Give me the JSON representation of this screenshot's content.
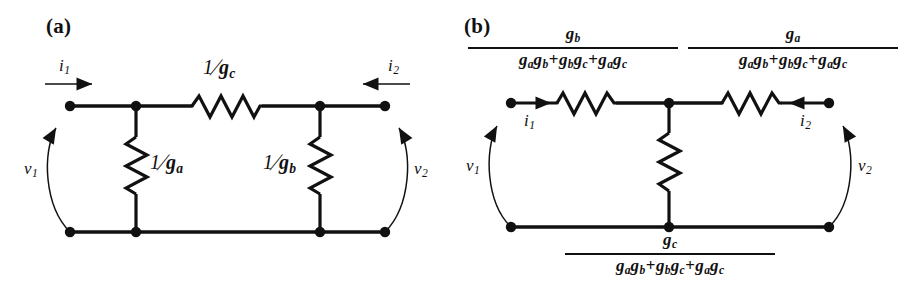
{
  "figure": {
    "background_color": "#ffffff",
    "ink_color": "#111111",
    "panels": [
      {
        "id": "a",
        "label": "(a)",
        "description": "Pi (delta) network of resistances",
        "port_labels": {
          "i1": {
            "symbol": "i",
            "subscript": "1",
            "arrow": "right"
          },
          "i2": {
            "symbol": "i",
            "subscript": "2",
            "arrow": "left"
          },
          "v1": {
            "symbol": "v",
            "subscript": "1"
          },
          "v2": {
            "symbol": "v",
            "subscript": "2"
          }
        },
        "elements": [
          {
            "name": "series-resistor-top",
            "numerator": "1",
            "denominator": "g",
            "denominator_subscript": "c",
            "orientation": "horizontal"
          },
          {
            "name": "shunt-resistor-left",
            "numerator": "1",
            "denominator": "g",
            "denominator_subscript": "a",
            "orientation": "vertical"
          },
          {
            "name": "shunt-resistor-right",
            "numerator": "1",
            "denominator": "g",
            "denominator_subscript": "b",
            "orientation": "vertical"
          }
        ]
      },
      {
        "id": "b",
        "label": "(b)",
        "description": "Equivalent tee (wye) network of resistances",
        "port_labels": {
          "i1": {
            "symbol": "i",
            "subscript": "1",
            "arrow": "right"
          },
          "i2": {
            "symbol": "i",
            "subscript": "2",
            "arrow": "left"
          },
          "v1": {
            "symbol": "v",
            "subscript": "1"
          },
          "v2": {
            "symbol": "v",
            "subscript": "2"
          }
        },
        "denominator_terms": [
          {
            "factors": [
              {
                "symbol": "g",
                "subscript": "a"
              },
              {
                "symbol": "g",
                "subscript": "b"
              }
            ]
          },
          {
            "factors": [
              {
                "symbol": "g",
                "subscript": "b"
              },
              {
                "symbol": "g",
                "subscript": "c"
              }
            ]
          },
          {
            "factors": [
              {
                "symbol": "g",
                "subscript": "a"
              },
              {
                "symbol": "g",
                "subscript": "c"
              }
            ]
          }
        ],
        "denominator_operator": "+",
        "elements": [
          {
            "name": "series-resistor-left",
            "numerator_symbol": "g",
            "numerator_subscript": "b",
            "orientation": "horizontal"
          },
          {
            "name": "series-resistor-right",
            "numerator_symbol": "g",
            "numerator_subscript": "a",
            "orientation": "horizontal"
          },
          {
            "name": "shunt-resistor-center",
            "numerator_symbol": "g",
            "numerator_subscript": "c",
            "orientation": "vertical"
          }
        ]
      }
    ]
  },
  "panel_a": {
    "label": "(a)",
    "res_top_num": "1",
    "res_top_den": "g",
    "res_top_sub": "c",
    "res_left_num": "1",
    "res_left_den": "g",
    "res_left_sub": "a",
    "res_right_num": "1",
    "res_right_den": "g",
    "res_right_sub": "b",
    "i1": "i",
    "i1_sub": "1",
    "i2": "i",
    "i2_sub": "2",
    "v1": "v",
    "v1_sub": "1",
    "v2": "v",
    "v2_sub": "2"
  },
  "panel_b": {
    "label": "(b)",
    "frac_left_num": "g",
    "frac_left_num_sub": "b",
    "frac_right_num": "g",
    "frac_right_num_sub": "a",
    "frac_bottom_num": "g",
    "frac_bottom_num_sub": "c",
    "den_g": "g",
    "den_sub_a": "a",
    "den_sub_b": "b",
    "den_sub_c": "c",
    "den_op": "+",
    "i1": "i",
    "i1_sub": "1",
    "i2": "i",
    "i2_sub": "2",
    "v1": "v",
    "v1_sub": "1",
    "v2": "v",
    "v2_sub": "2"
  }
}
